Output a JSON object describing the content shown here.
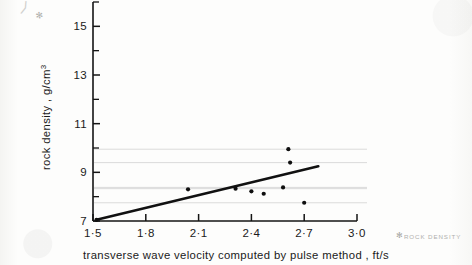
{
  "figure": {
    "kind": "scanned-scatter-plot",
    "annotations": {
      "corner_asterisk": "✻",
      "corner_note": "ROCK DENSITY",
      "top_asterisk": "✻",
      "top_stroke": "⟩"
    }
  },
  "chart_data": {
    "type": "scatter",
    "title": "",
    "xlabel": "transverse  wave  velocity  computed  by  pulse  method , ft/s",
    "ylabel_main": "rock density , g/cm",
    "ylabel_exponent": "3",
    "xlim": [
      1.5,
      3.0
    ],
    "ylim": [
      7,
      16
    ],
    "grid": false,
    "legend": "none",
    "x_ticks": [
      1.5,
      1.8,
      2.1,
      2.4,
      2.7,
      3.0
    ],
    "x_tick_labels": [
      "1·5",
      "1·8",
      "2·1",
      "2·4",
      "2·7",
      "3·0"
    ],
    "y_ticks": [
      7,
      9,
      11,
      13,
      15
    ],
    "y_tick_labels": [
      "7",
      "9",
      "11",
      "13",
      "15"
    ],
    "y_minor_ticks": [
      8,
      10,
      12,
      14,
      16
    ],
    "points": [
      {
        "x": 1.52,
        "y": 7.05
      },
      {
        "x": 2.04,
        "y": 8.3
      },
      {
        "x": 2.31,
        "y": 8.33
      },
      {
        "x": 2.4,
        "y": 8.22
      },
      {
        "x": 2.47,
        "y": 8.12
      },
      {
        "x": 2.58,
        "y": 8.38
      },
      {
        "x": 2.61,
        "y": 9.95
      },
      {
        "x": 2.62,
        "y": 9.4
      },
      {
        "x": 2.7,
        "y": 7.75
      }
    ],
    "guide_lines_at_y": [
      9.95,
      9.4,
      8.38,
      8.33,
      7.75
    ],
    "fit_line": {
      "x0": 1.52,
      "y0": 7.05,
      "x1": 2.78,
      "y1": 9.25
    }
  }
}
